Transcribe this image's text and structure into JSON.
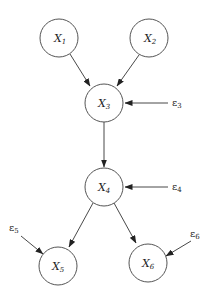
{
  "diagram": {
    "type": "causal-graph",
    "nodes": [
      {
        "id": "X1",
        "var": "X",
        "sub": "1",
        "cx": 59,
        "cy": 38
      },
      {
        "id": "X2",
        "var": "X",
        "sub": "2",
        "cx": 149,
        "cy": 38
      },
      {
        "id": "X3",
        "var": "X",
        "sub": "3",
        "cx": 104,
        "cy": 103
      },
      {
        "id": "X4",
        "var": "X",
        "sub": "4",
        "cx": 104,
        "cy": 187
      },
      {
        "id": "X5",
        "var": "X",
        "sub": "5",
        "cx": 58,
        "cy": 266
      },
      {
        "id": "X6",
        "var": "X",
        "sub": "6",
        "cx": 148,
        "cy": 263
      }
    ],
    "noise": [
      {
        "id": "e3",
        "symbol": "ε",
        "sub": "3",
        "target": "X3"
      },
      {
        "id": "e4",
        "symbol": "ε",
        "sub": "4",
        "target": "X4"
      },
      {
        "id": "e5",
        "symbol": "ε",
        "sub": "5",
        "target": "X5"
      },
      {
        "id": "e6",
        "symbol": "ε",
        "sub": "6",
        "target": "X6"
      }
    ],
    "edges": [
      {
        "from": "X1",
        "to": "X3"
      },
      {
        "from": "X2",
        "to": "X3"
      },
      {
        "from": "X3",
        "to": "X4"
      },
      {
        "from": "X4",
        "to": "X5"
      },
      {
        "from": "X4",
        "to": "X6"
      },
      {
        "from": "e3",
        "to": "X3"
      },
      {
        "from": "e4",
        "to": "X4"
      },
      {
        "from": "e5",
        "to": "X5"
      },
      {
        "from": "e6",
        "to": "X6"
      }
    ]
  }
}
